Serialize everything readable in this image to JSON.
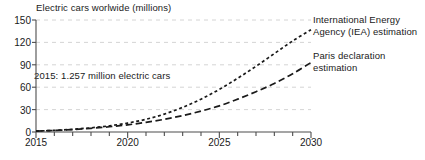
{
  "chart_data": {
    "type": "line",
    "title": "Electric cars worlwide (millions)",
    "xlabel": "",
    "ylabel": "",
    "xlim": [
      2015,
      2030
    ],
    "ylim": [
      0,
      150
    ],
    "yticks": [
      0,
      30,
      60,
      90,
      120,
      150
    ],
    "xticks": [
      2015,
      2020,
      2025,
      2030
    ],
    "x_minor_tick_step": 1,
    "grid": true,
    "grid_style": "dashed-horizontal-light-gray",
    "legend_position": "right-inline-annotations",
    "annotations": [
      {
        "name": "baseline-note",
        "text": "2015: 1.257 million electric cars",
        "x": 2015.6,
        "y": 72
      }
    ],
    "x": [
      2015,
      2016,
      2017,
      2018,
      2019,
      2020,
      2021,
      2022,
      2023,
      2024,
      2025,
      2026,
      2027,
      2028,
      2029,
      2030
    ],
    "series": [
      {
        "name": "International Energy Agency (IEA) estimation",
        "label_lines": [
          "International Energy",
          "Agency (IEA) estimation"
        ],
        "dash": "short-dash",
        "color": "#1a1a1a",
        "values": [
          1.257,
          2.2,
          3.6,
          5.6,
          8.3,
          12,
          17,
          24,
          33,
          44,
          57,
          72,
          88,
          105,
          122,
          137
        ]
      },
      {
        "name": "Paris declaration estimation",
        "label_lines": [
          "Paris declaration",
          "estimation"
        ],
        "dash": "long-dash",
        "color": "#1a1a1a",
        "values": [
          1.257,
          2.1,
          3.3,
          4.9,
          7.0,
          9.6,
          13,
          17,
          22,
          28,
          35,
          44,
          54,
          65,
          78,
          93
        ]
      }
    ]
  },
  "axis": {
    "ytick_labels": [
      "0",
      "30",
      "60",
      "90",
      "120",
      "150"
    ],
    "xtick_labels": [
      "2015",
      "2020",
      "2025",
      "2030"
    ]
  }
}
